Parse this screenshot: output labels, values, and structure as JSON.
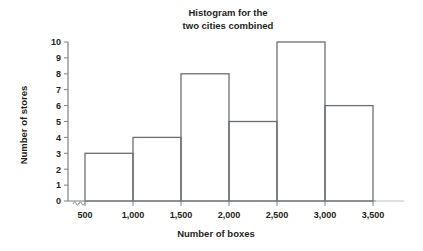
{
  "chart_data": {
    "type": "bar",
    "title": "Histogram for the two cities combined",
    "title_line1": "Histogram for the",
    "title_line2": "two cities combined",
    "xlabel": "Number of boxes",
    "ylabel": "Number of stores",
    "categories": [
      "500-1,000",
      "1,000-1,500",
      "1,500-2,000",
      "2,000-2,500",
      "2,500-3,000",
      "3,000-3,500"
    ],
    "bin_edges": [
      500,
      1000,
      1500,
      2000,
      2500,
      3000,
      3500
    ],
    "values": [
      3,
      4,
      8,
      5,
      10,
      6
    ],
    "xlim": [
      500,
      3500
    ],
    "ylim": [
      0,
      10
    ],
    "x_ticks": [
      500,
      1000,
      1500,
      2000,
      2500,
      3000,
      3500
    ],
    "x_tick_labels": [
      "500",
      "1,000",
      "1,500",
      "2,000",
      "2,500",
      "3,000",
      "3,500"
    ],
    "y_ticks": [
      0,
      1,
      2,
      3,
      4,
      5,
      6,
      7,
      8,
      9,
      10
    ],
    "y_tick_labels": [
      "0",
      "1",
      "2",
      "3",
      "4",
      "5",
      "6",
      "7",
      "8",
      "9",
      "10"
    ],
    "grid": false,
    "legend": "none",
    "y_axis_break": true,
    "bar_stroke_color": "#6a6f75",
    "bar_fill_color": "#ffffff",
    "axis_color": "#7d8287",
    "text_color": "#231f20"
  }
}
